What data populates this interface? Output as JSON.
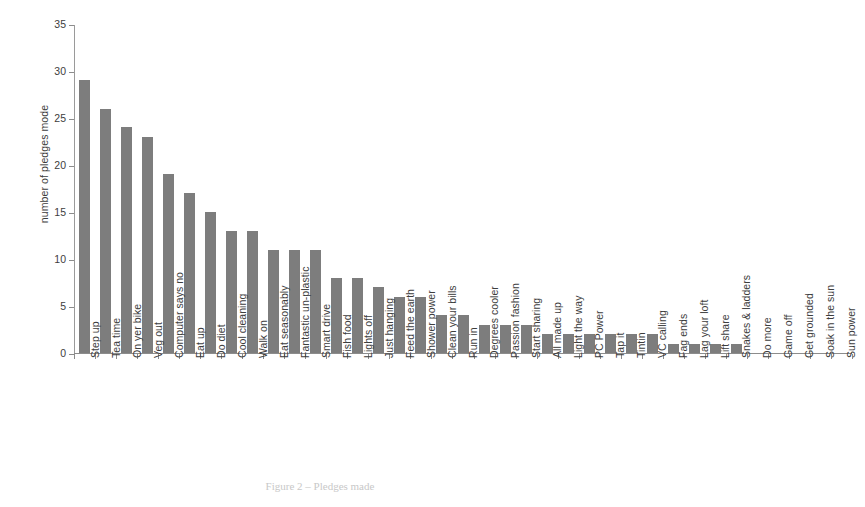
{
  "figure": {
    "caption": "Figure 2 – Pledges made",
    "bar_color": "#7d7d7d",
    "axis_color": "#8c8c8c"
  },
  "chart_data": {
    "type": "bar",
    "title": "",
    "xlabel": "",
    "ylabel": "number of pledges mode",
    "ylim": [
      0,
      35
    ],
    "ytick_labels": [
      "0",
      "5",
      "10",
      "15",
      "20",
      "25",
      "30",
      "35"
    ],
    "yticks": [
      0,
      5,
      10,
      15,
      20,
      25,
      30,
      35
    ],
    "grid": false,
    "legend": null,
    "categories": [
      "Step up",
      "Tea time",
      "On yer bike",
      "Veg out",
      "Computer says no",
      "Eat up",
      "Do diet",
      "Cool cleaning",
      "Walk on",
      "Eat seasonably",
      "Fantastic un-plastic",
      "Smart drive",
      "Fish food",
      "Lights off",
      "Just hanging",
      "Feed the earth",
      "Shower power",
      "Clean your bills",
      "Run in",
      "Degrees cooler",
      "Passion fashion",
      "Start sharing",
      "All made up",
      "Light the way",
      "PC Power",
      "Tap it",
      "Tintin",
      "VC calling",
      "Fag ends",
      "Lag your loft",
      "Lift share",
      "Snakes & ladders",
      "Do more",
      "Game off",
      "Get grounded",
      "Soak in the sun",
      "Sun power"
    ],
    "values": [
      29,
      26,
      24,
      23,
      19,
      17,
      15,
      13,
      13,
      11,
      11,
      11,
      8,
      8,
      7,
      6,
      6,
      4,
      4,
      3,
      3,
      3,
      2,
      2,
      2,
      2,
      2,
      2,
      1,
      1,
      1,
      1,
      0,
      0,
      0,
      0,
      0
    ]
  }
}
